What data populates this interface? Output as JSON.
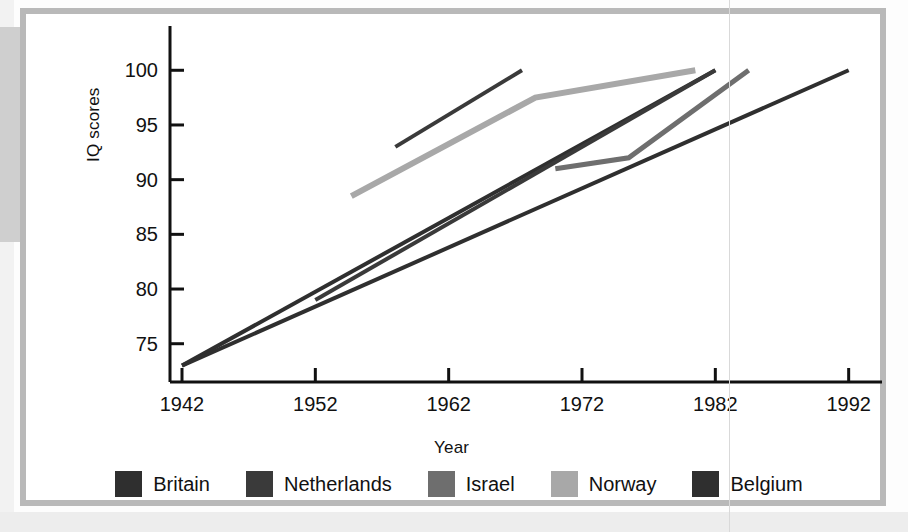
{
  "figure": {
    "axis": {
      "ylabel": "IQ scores",
      "xlabel": "Year",
      "yticks": [
        100,
        95,
        90,
        85,
        80,
        75
      ],
      "xticks": [
        1942,
        1952,
        1962,
        1972,
        1982,
        1992
      ],
      "ylim": [
        71.5,
        103.5
      ],
      "xlim": [
        1940.2,
        1994.5
      ]
    },
    "legend": {
      "items": [
        {
          "label": "Britain",
          "color": "#2f2f2f"
        },
        {
          "label": "Netherlands",
          "color": "#3a3a3a"
        },
        {
          "label": "Israel",
          "color": "#6e6e6e"
        },
        {
          "label": "Norway",
          "color": "#a8a8a8"
        },
        {
          "label": "Belgium",
          "color": "#2f2f2f"
        }
      ]
    }
  },
  "chart_data": {
    "type": "line",
    "title": "",
    "xlabel": "Year",
    "ylabel": "IQ scores",
    "xlim": [
      1940.2,
      1994.5
    ],
    "ylim": [
      71.5,
      103.5
    ],
    "xticks": [
      1942,
      1952,
      1962,
      1972,
      1982,
      1992
    ],
    "yticks": [
      75,
      80,
      85,
      90,
      95,
      100
    ],
    "grid": false,
    "legend_position": "bottom",
    "series": [
      {
        "name": "Britain",
        "color": "#2f2f2f",
        "width": 4,
        "points": [
          [
            1942,
            73.0
          ],
          [
            1982,
            100.0
          ]
        ]
      },
      {
        "name": "Netherlands",
        "color": "#3a3a3a",
        "width": 4,
        "points": [
          [
            1952,
            79.0
          ],
          [
            1982,
            100.0
          ]
        ]
      },
      {
        "name": "Netherlands-2",
        "color": "#3a3a3a",
        "width": 4,
        "points": [
          [
            1958,
            93.0
          ],
          [
            1967.5,
            100.0
          ]
        ]
      },
      {
        "name": "Israel",
        "color": "#6e6e6e",
        "width": 5,
        "points": [
          [
            1970,
            91.0
          ],
          [
            1975.5,
            92.0
          ],
          [
            1984.5,
            100.0
          ]
        ]
      },
      {
        "name": "Norway",
        "color": "#a8a8a8",
        "width": 6,
        "points": [
          [
            1954.7,
            88.5
          ],
          [
            1968.5,
            97.5
          ],
          [
            1980.5,
            100.0
          ]
        ]
      },
      {
        "name": "Belgium",
        "color": "#2f2f2f",
        "width": 4,
        "points": [
          [
            1942,
            73.0
          ],
          [
            1992,
            100.0
          ]
        ]
      }
    ]
  }
}
